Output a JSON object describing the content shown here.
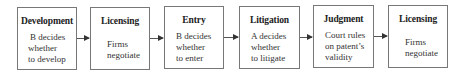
{
  "stages": [
    {
      "title": "Development",
      "lines": [
        "B decides",
        "whether",
        "to develop"
      ]
    },
    {
      "title": "Licensing",
      "lines": [
        "Firms",
        "negotiate"
      ]
    },
    {
      "title": "Entry",
      "lines": [
        "B decides",
        "whether",
        "to enter"
      ]
    },
    {
      "title": "Litigation",
      "lines": [
        "A decides",
        "whether",
        "to litigate"
      ]
    },
    {
      "title": "Judgment",
      "lines": [
        "Court rules",
        "on patent’s",
        "validity"
      ]
    },
    {
      "title": "Licensing",
      "lines": [
        "Firms",
        "negotiate"
      ]
    }
  ]
}
